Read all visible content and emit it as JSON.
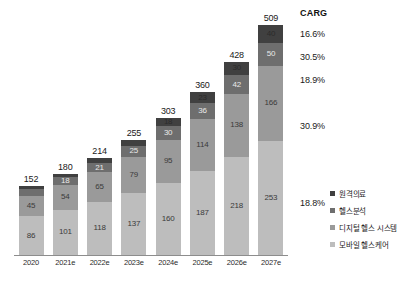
{
  "chart_data": {
    "type": "bar",
    "subtype": "stacked-bar",
    "title": "",
    "xlabel": "",
    "ylabel": "",
    "grid": false,
    "legend_position": "right-bottom",
    "categories": [
      "2020",
      "2021e",
      "2022e",
      "2023e",
      "2024e",
      "2025e",
      "2026e",
      "2027e"
    ],
    "totals": [
      152,
      180,
      214,
      255,
      303,
      360,
      428,
      509
    ],
    "series": [
      {
        "name": "모바일 헬스케어",
        "color": "#bdbdbd",
        "values": [
          86,
          101,
          118,
          137,
          160,
          187,
          218,
          253
        ]
      },
      {
        "name": "디지털 헬스 시스템",
        "color": "#9a9a9a",
        "values": [
          45,
          54,
          65,
          79,
          95,
          114,
          138,
          166
        ]
      },
      {
        "name": "헬스분석",
        "color": "#6e6e6e",
        "values": [
          15,
          18,
          21,
          25,
          30,
          36,
          42,
          50
        ]
      },
      {
        "name": "원격의료",
        "color": "#404040",
        "values": [
          6,
          8,
          10,
          13,
          18,
          23,
          30,
          40
        ]
      }
    ],
    "ylim": [
      0,
      509
    ],
    "annotations": {
      "carg_header": "CARG",
      "carg_values": [
        "16.6%",
        "30.5%",
        "18.9%",
        "30.9%",
        "18.8%"
      ]
    }
  },
  "carg": {
    "header": "CARG",
    "rows": [
      {
        "label": "16.6%",
        "top": 21
      },
      {
        "label": "30.5%",
        "top": 44
      },
      {
        "label": "18.9%",
        "top": 67
      },
      {
        "label": "30.9%",
        "top": 113
      },
      {
        "label": "18.8%",
        "top": 190
      }
    ]
  },
  "legend": {
    "items": [
      {
        "label": "원격의료",
        "color": "#404040"
      },
      {
        "label": "헬스분석",
        "color": "#6e6e6e"
      },
      {
        "label": "디지털 헬스 시스템",
        "color": "#9a9a9a"
      },
      {
        "label": "모바일 헬스케어",
        "color": "#bdbdbd"
      }
    ]
  }
}
